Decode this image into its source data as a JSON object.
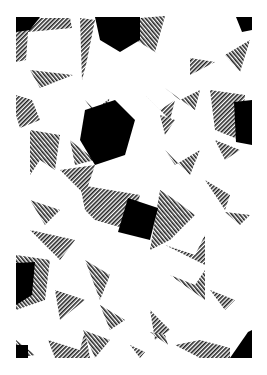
{
  "artwork": {
    "description": "Abstract geometric composition of overlapping rotated white squares with black and cross-hatched triangular shadows",
    "colors": {
      "background": "#ffffff",
      "solid": "#000000",
      "hatch": "#333333"
    },
    "bounds": {
      "x": 15,
      "y": 15,
      "width": 237,
      "height": 343
    }
  },
  "caption": {
    "text": ""
  }
}
